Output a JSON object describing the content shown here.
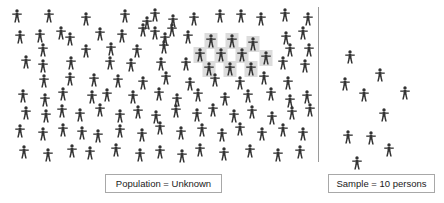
{
  "figure": {
    "background_color": "#ffffff",
    "person_color": "#333333",
    "highlight_color": "#dcdcdc",
    "divider_color": "#9a9a9a"
  },
  "population_panel": {
    "name": "Population",
    "caption": "Population = Unknown",
    "icon_name": "person-icon",
    "total_persons": 118,
    "highlighted_persons": 10,
    "persons": [
      {
        "x": 17,
        "y": 16,
        "highlighted": false
      },
      {
        "x": 49,
        "y": 16,
        "highlighted": false
      },
      {
        "x": 86,
        "y": 19,
        "highlighted": false
      },
      {
        "x": 125,
        "y": 16,
        "highlighted": false
      },
      {
        "x": 155,
        "y": 15,
        "highlighted": false
      },
      {
        "x": 147,
        "y": 23,
        "highlighted": false
      },
      {
        "x": 173,
        "y": 21,
        "highlighted": false
      },
      {
        "x": 194,
        "y": 19,
        "highlighted": false
      },
      {
        "x": 220,
        "y": 16,
        "highlighted": false
      },
      {
        "x": 241,
        "y": 16,
        "highlighted": false
      },
      {
        "x": 261,
        "y": 19,
        "highlighted": false
      },
      {
        "x": 285,
        "y": 15,
        "highlighted": false
      },
      {
        "x": 308,
        "y": 19,
        "highlighted": false
      },
      {
        "x": 20,
        "y": 37,
        "highlighted": false
      },
      {
        "x": 40,
        "y": 36,
        "highlighted": false
      },
      {
        "x": 61,
        "y": 33,
        "highlighted": false
      },
      {
        "x": 70,
        "y": 39,
        "highlighted": false
      },
      {
        "x": 100,
        "y": 34,
        "highlighted": false
      },
      {
        "x": 122,
        "y": 36,
        "highlighted": false
      },
      {
        "x": 143,
        "y": 30,
        "highlighted": false
      },
      {
        "x": 155,
        "y": 33,
        "highlighted": false
      },
      {
        "x": 172,
        "y": 30,
        "highlighted": false
      },
      {
        "x": 165,
        "y": 39,
        "highlighted": false
      },
      {
        "x": 188,
        "y": 37,
        "highlighted": false
      },
      {
        "x": 211,
        "y": 41,
        "highlighted": true
      },
      {
        "x": 232,
        "y": 41,
        "highlighted": true
      },
      {
        "x": 253,
        "y": 44,
        "highlighted": true
      },
      {
        "x": 286,
        "y": 38,
        "highlighted": false
      },
      {
        "x": 303,
        "y": 33,
        "highlighted": false
      },
      {
        "x": 43,
        "y": 50,
        "highlighted": false
      },
      {
        "x": 86,
        "y": 51,
        "highlighted": false
      },
      {
        "x": 111,
        "y": 49,
        "highlighted": false
      },
      {
        "x": 137,
        "y": 51,
        "highlighted": false
      },
      {
        "x": 200,
        "y": 55,
        "highlighted": true
      },
      {
        "x": 221,
        "y": 55,
        "highlighted": true
      },
      {
        "x": 242,
        "y": 55,
        "highlighted": true
      },
      {
        "x": 266,
        "y": 58,
        "highlighted": true
      },
      {
        "x": 164,
        "y": 47,
        "highlighted": false
      },
      {
        "x": 290,
        "y": 50,
        "highlighted": false
      },
      {
        "x": 309,
        "y": 50,
        "highlighted": false
      },
      {
        "x": 26,
        "y": 62,
        "highlighted": false
      },
      {
        "x": 43,
        "y": 66,
        "highlighted": false
      },
      {
        "x": 71,
        "y": 63,
        "highlighted": false
      },
      {
        "x": 110,
        "y": 63,
        "highlighted": false
      },
      {
        "x": 131,
        "y": 65,
        "highlighted": false
      },
      {
        "x": 161,
        "y": 64,
        "highlighted": false
      },
      {
        "x": 209,
        "y": 69,
        "highlighted": true
      },
      {
        "x": 230,
        "y": 69,
        "highlighted": true
      },
      {
        "x": 251,
        "y": 69,
        "highlighted": true
      },
      {
        "x": 186,
        "y": 64,
        "highlighted": false
      },
      {
        "x": 283,
        "y": 63,
        "highlighted": false
      },
      {
        "x": 305,
        "y": 66,
        "highlighted": false
      },
      {
        "x": 44,
        "y": 81,
        "highlighted": false
      },
      {
        "x": 70,
        "y": 79,
        "highlighted": false
      },
      {
        "x": 94,
        "y": 80,
        "highlighted": false
      },
      {
        "x": 118,
        "y": 81,
        "highlighted": false
      },
      {
        "x": 143,
        "y": 83,
        "highlighted": false
      },
      {
        "x": 166,
        "y": 78,
        "highlighted": false
      },
      {
        "x": 190,
        "y": 84,
        "highlighted": false
      },
      {
        "x": 215,
        "y": 80,
        "highlighted": false
      },
      {
        "x": 240,
        "y": 83,
        "highlighted": false
      },
      {
        "x": 264,
        "y": 78,
        "highlighted": false
      },
      {
        "x": 288,
        "y": 83,
        "highlighted": false
      },
      {
        "x": 23,
        "y": 96,
        "highlighted": false
      },
      {
        "x": 45,
        "y": 100,
        "highlighted": false
      },
      {
        "x": 63,
        "y": 94,
        "highlighted": false
      },
      {
        "x": 92,
        "y": 97,
        "highlighted": false
      },
      {
        "x": 107,
        "y": 95,
        "highlighted": false
      },
      {
        "x": 133,
        "y": 97,
        "highlighted": false
      },
      {
        "x": 159,
        "y": 94,
        "highlighted": false
      },
      {
        "x": 177,
        "y": 100,
        "highlighted": false
      },
      {
        "x": 198,
        "y": 95,
        "highlighted": false
      },
      {
        "x": 225,
        "y": 99,
        "highlighted": false
      },
      {
        "x": 248,
        "y": 96,
        "highlighted": false
      },
      {
        "x": 271,
        "y": 94,
        "highlighted": false
      },
      {
        "x": 290,
        "y": 101,
        "highlighted": false
      },
      {
        "x": 307,
        "y": 97,
        "highlighted": false
      },
      {
        "x": 26,
        "y": 113,
        "highlighted": false
      },
      {
        "x": 46,
        "y": 116,
        "highlighted": false
      },
      {
        "x": 62,
        "y": 111,
        "highlighted": false
      },
      {
        "x": 80,
        "y": 115,
        "highlighted": false
      },
      {
        "x": 100,
        "y": 110,
        "highlighted": false
      },
      {
        "x": 120,
        "y": 116,
        "highlighted": false
      },
      {
        "x": 138,
        "y": 112,
        "highlighted": false
      },
      {
        "x": 156,
        "y": 117,
        "highlighted": false
      },
      {
        "x": 176,
        "y": 111,
        "highlighted": false
      },
      {
        "x": 197,
        "y": 115,
        "highlighted": false
      },
      {
        "x": 213,
        "y": 110,
        "highlighted": false
      },
      {
        "x": 234,
        "y": 116,
        "highlighted": false
      },
      {
        "x": 252,
        "y": 112,
        "highlighted": false
      },
      {
        "x": 272,
        "y": 118,
        "highlighted": false
      },
      {
        "x": 292,
        "y": 113,
        "highlighted": false
      },
      {
        "x": 310,
        "y": 110,
        "highlighted": false
      },
      {
        "x": 20,
        "y": 131,
        "highlighted": false
      },
      {
        "x": 43,
        "y": 134,
        "highlighted": false
      },
      {
        "x": 63,
        "y": 130,
        "highlighted": false
      },
      {
        "x": 82,
        "y": 133,
        "highlighted": false
      },
      {
        "x": 98,
        "y": 136,
        "highlighted": false
      },
      {
        "x": 120,
        "y": 131,
        "highlighted": false
      },
      {
        "x": 142,
        "y": 135,
        "highlighted": false
      },
      {
        "x": 160,
        "y": 128,
        "highlighted": false
      },
      {
        "x": 181,
        "y": 133,
        "highlighted": false
      },
      {
        "x": 202,
        "y": 130,
        "highlighted": false
      },
      {
        "x": 222,
        "y": 135,
        "highlighted": false
      },
      {
        "x": 240,
        "y": 129,
        "highlighted": false
      },
      {
        "x": 262,
        "y": 134,
        "highlighted": false
      },
      {
        "x": 283,
        "y": 130,
        "highlighted": false
      },
      {
        "x": 303,
        "y": 134,
        "highlighted": false
      },
      {
        "x": 24,
        "y": 152,
        "highlighted": false
      },
      {
        "x": 48,
        "y": 155,
        "highlighted": false
      },
      {
        "x": 72,
        "y": 151,
        "highlighted": false
      },
      {
        "x": 90,
        "y": 153,
        "highlighted": false
      },
      {
        "x": 116,
        "y": 150,
        "highlighted": false
      },
      {
        "x": 140,
        "y": 155,
        "highlighted": false
      },
      {
        "x": 160,
        "y": 152,
        "highlighted": false
      },
      {
        "x": 182,
        "y": 156,
        "highlighted": false
      },
      {
        "x": 200,
        "y": 150,
        "highlighted": false
      },
      {
        "x": 224,
        "y": 154,
        "highlighted": false
      },
      {
        "x": 250,
        "y": 151,
        "highlighted": false
      },
      {
        "x": 278,
        "y": 155,
        "highlighted": false
      },
      {
        "x": 300,
        "y": 152,
        "highlighted": false
      }
    ]
  },
  "sample_panel": {
    "name": "Sample",
    "caption": "Sample = 10 persons",
    "icon_name": "person-icon",
    "total_persons": 10,
    "persons": [
      {
        "x": 350,
        "y": 57,
        "highlighted": false
      },
      {
        "x": 380,
        "y": 75,
        "highlighted": false
      },
      {
        "x": 345,
        "y": 84,
        "highlighted": false
      },
      {
        "x": 364,
        "y": 95,
        "highlighted": false
      },
      {
        "x": 405,
        "y": 93,
        "highlighted": false
      },
      {
        "x": 384,
        "y": 115,
        "highlighted": false
      },
      {
        "x": 348,
        "y": 137,
        "highlighted": false
      },
      {
        "x": 371,
        "y": 138,
        "highlighted": false
      },
      {
        "x": 389,
        "y": 150,
        "highlighted": false
      },
      {
        "x": 357,
        "y": 163,
        "highlighted": false
      }
    ]
  }
}
